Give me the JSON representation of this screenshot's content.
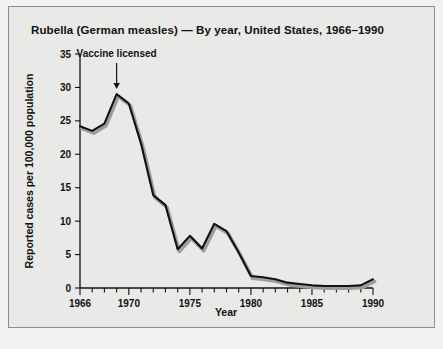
{
  "figure": {
    "title": "Rubella (German measles) — By year, United States, 1966–1990",
    "background_color": "#e9e9e7",
    "border_color": "#8d8d8a",
    "line_color": "#111111",
    "shadow_color": "#9d9d9b"
  },
  "chart_data": {
    "type": "line",
    "title": "Rubella (German measles) — By year, United States, 1966–1990",
    "xlabel": "Year",
    "ylabel": "Reported cases per 100,000 population",
    "xlim": [
      1966,
      1990
    ],
    "ylim": [
      0,
      35
    ],
    "grid": false,
    "legend": "none",
    "x_tick_labels": [
      "1966",
      "1970",
      "1975",
      "1980",
      "1985",
      "1990"
    ],
    "x_tick_values": [
      1966,
      1970,
      1975,
      1980,
      1985,
      1990
    ],
    "x_minor_tick_step": 1,
    "y_tick_labels": [
      "0",
      "5",
      "10",
      "15",
      "20",
      "25",
      "30",
      "35"
    ],
    "y_tick_values": [
      0,
      5,
      10,
      15,
      20,
      25,
      30,
      35
    ],
    "x": [
      1966,
      1967,
      1968,
      1969,
      1970,
      1971,
      1972,
      1973,
      1974,
      1975,
      1976,
      1977,
      1978,
      1979,
      1980,
      1981,
      1982,
      1983,
      1984,
      1985,
      1986,
      1987,
      1988,
      1989,
      1990
    ],
    "values": [
      24.2,
      23.5,
      24.6,
      29.0,
      27.6,
      21.6,
      13.9,
      12.4,
      5.8,
      7.8,
      5.9,
      9.6,
      8.5,
      5.3,
      1.8,
      1.6,
      1.3,
      0.8,
      0.6,
      0.4,
      0.3,
      0.3,
      0.3,
      0.4,
      1.3
    ],
    "series": [
      {
        "name": "Reported rubella cases per 100,000 population",
        "values": [
          24.2,
          23.5,
          24.6,
          29.0,
          27.6,
          21.6,
          13.9,
          12.4,
          5.8,
          7.8,
          5.9,
          9.6,
          8.5,
          5.3,
          1.8,
          1.6,
          1.3,
          0.8,
          0.6,
          0.4,
          0.3,
          0.3,
          0.3,
          0.4,
          1.3
        ]
      }
    ],
    "annotations": [
      {
        "text": "Vaccine licensed",
        "x": 1969,
        "y": 29.0,
        "arrow": "down"
      }
    ]
  }
}
